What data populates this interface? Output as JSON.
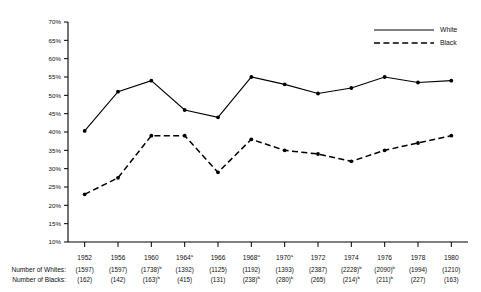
{
  "chart_data": {
    "type": "line",
    "title": "",
    "xlabel": "",
    "ylabel": "",
    "ylim": [
      10,
      70
    ],
    "ytick_labels": [
      "10%",
      "15%",
      "20%",
      "25%",
      "30%",
      "35%",
      "40%",
      "45%",
      "50%",
      "55%",
      "60%",
      "65%",
      "70%"
    ],
    "ytick_values": [
      10,
      15,
      20,
      25,
      30,
      35,
      40,
      45,
      50,
      55,
      60,
      65,
      70
    ],
    "grid": false,
    "legend_position": "top-right",
    "categories": [
      "1952",
      "1956",
      "1960",
      "1964",
      "1966",
      "1968",
      "1970",
      "1972",
      "1974",
      "1976",
      "1978",
      "1980"
    ],
    "category_superscripts": [
      "",
      "",
      "",
      "a",
      "",
      "a",
      "a",
      "",
      "",
      "",
      "",
      ""
    ],
    "series": [
      {
        "name": "White",
        "style": "solid",
        "values": [
          40.3,
          51.0,
          54.0,
          46.0,
          44.0,
          55.0,
          53.0,
          50.5,
          52.0,
          55.0,
          53.5,
          54.0
        ]
      },
      {
        "name": "Black",
        "style": "dashed",
        "values": [
          23.0,
          27.5,
          39.0,
          39.0,
          29.0,
          38.0,
          35.0,
          34.0,
          32.0,
          35.0,
          37.0,
          39.0
        ]
      }
    ]
  },
  "legend": {
    "entries": [
      {
        "label": "White",
        "style": "solid"
      },
      {
        "label": "Black",
        "style": "dashed"
      }
    ]
  },
  "table": {
    "row_labels": [
      "Number of Whites:",
      "Number of Blacks:"
    ],
    "whites": [
      {
        "value": "(1597)",
        "sup": ""
      },
      {
        "value": "(1597)",
        "sup": ""
      },
      {
        "value": "(1738)",
        "sup": "b"
      },
      {
        "value": "(1392)",
        "sup": ""
      },
      {
        "value": "(1125)",
        "sup": ""
      },
      {
        "value": "(1192)",
        "sup": ""
      },
      {
        "value": "(1393)",
        "sup": ""
      },
      {
        "value": "(2387)",
        "sup": ""
      },
      {
        "value": "(2228)",
        "sup": "b"
      },
      {
        "value": "(2090)",
        "sup": "b"
      },
      {
        "value": "(1994)",
        "sup": ""
      },
      {
        "value": "(1210)",
        "sup": ""
      }
    ],
    "blacks": [
      {
        "value": "(162)",
        "sup": ""
      },
      {
        "value": "(142)",
        "sup": ""
      },
      {
        "value": "(163)",
        "sup": "b"
      },
      {
        "value": "(415)",
        "sup": ""
      },
      {
        "value": "(131)",
        "sup": ""
      },
      {
        "value": "(238)",
        "sup": "b"
      },
      {
        "value": "(280)",
        "sup": "b"
      },
      {
        "value": "(265)",
        "sup": ""
      },
      {
        "value": "(214)",
        "sup": "b"
      },
      {
        "value": "(211)",
        "sup": "b"
      },
      {
        "value": "(227)",
        "sup": ""
      },
      {
        "value": "(163)",
        "sup": ""
      }
    ]
  },
  "colors": {
    "ink": "#000000",
    "background": "#ffffff"
  }
}
